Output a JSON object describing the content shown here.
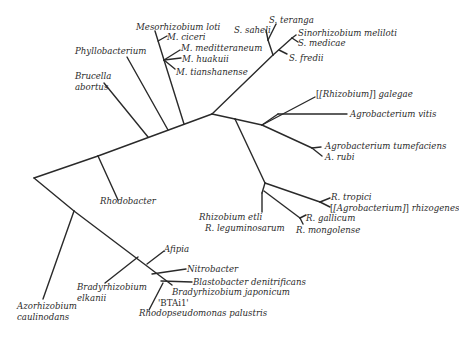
{
  "diagram": {
    "type": "phylogenetic-tree",
    "line_color": "#2a2a2a",
    "text_color": "#2b2b2b",
    "taxa": {
      "mesorhizobium_loti": "Mesorhizobium  loti",
      "m_ciceri": "M. ciceri",
      "m_mediterraneum": "M. meditteraneum",
      "m_huakuii": "M. huakuii",
      "m_tianshanense": "M. tianshanense",
      "phyllobacterium": "Phyllobacterium",
      "brucella_1": "Brucella",
      "brucella_2": "abortus",
      "s_teranga": "S. teranga",
      "s_saheli": "S.  saheli",
      "sinorhizobium_meliloti": "Sinorhizobium meliloti",
      "s_medicae": "S. medicae",
      "s_fredii": "S. fredii",
      "rhizobium_galegae_bracket": "[Rhizobium]",
      "rhizobium_galegae_species": " galegae",
      "agrobacterium_vitis": "Agrobacterium vitis",
      "agrobacterium_tumefaciens": "Agrobacterium tumefaciens",
      "a_rubi": "A. rubi",
      "rhodobacter": "Rhodobacter",
      "r_tropici": "R. tropici",
      "agrobacterium_rhizogenes_bracket": "[Agrobacterium]",
      "agrobacterium_rhizogenes_species": " rhizogenes",
      "rhizobium_etli": "Rhizobium  etli",
      "r_leguminosarum": "R. leguminosarum",
      "r_gallicum": "R. gallicum",
      "r_mongolense": "R. mongolense",
      "afipia": "Afipia",
      "nitrobacter": "Nitrobacter",
      "blastobacter": "Blastobacter denitrificans",
      "bradyrhizobium_japonicum": "Bradyrhizobium japonicum",
      "btai1": "'BTAi1'",
      "rhodopseudomonas": "Rhodopseudomonas palustris",
      "bradyrhizobium_elkanii_1": "Bradyrhizobium",
      "bradyrhizobium_elkanii_2": "elkanii",
      "azorhizobium_1": "Azorhizobium",
      "azorhizobium_2": "caulinodans"
    }
  }
}
